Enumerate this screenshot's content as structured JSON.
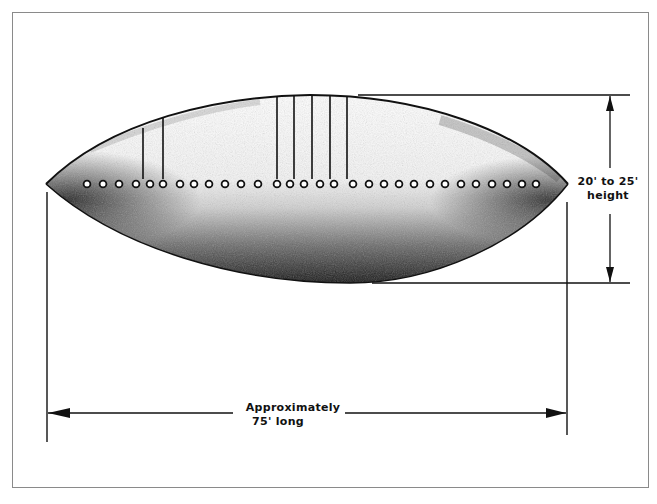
{
  "figure": {
    "dimensions": {
      "height": {
        "line1": "20' to 25'",
        "line2": "height"
      },
      "length": {
        "line1": "Approximately",
        "line2": "75' long"
      }
    },
    "port_hole_count": 30,
    "vertical_markings": [
      {
        "x": 143,
        "y_top": 128
      },
      {
        "x": 163,
        "y_top": 117
      },
      {
        "x": 277,
        "y_top": 96
      },
      {
        "x": 294,
        "y_top": 95
      },
      {
        "x": 312,
        "y_top": 95
      },
      {
        "x": 330,
        "y_top": 95
      },
      {
        "x": 347,
        "y_top": 96
      }
    ],
    "colors": {
      "ink": "#111111",
      "frame": "#8a8a8a",
      "background": "#ffffff"
    }
  }
}
